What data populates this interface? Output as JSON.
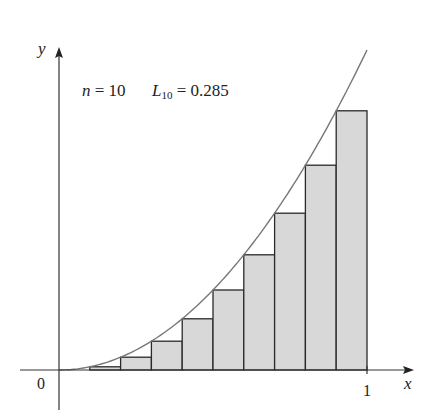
{
  "chart_data": {
    "type": "bar",
    "title": "",
    "annotation": {
      "n_label": "n",
      "n_eq": " = 10",
      "L_label": "L",
      "L_sub": "10",
      "L_eq": " = 0.285"
    },
    "function": "x^2",
    "method": "left Riemann sum",
    "n": 10,
    "sum_value": 0.285,
    "xlabel": "x",
    "ylabel": "y",
    "x_ticks": [
      {
        "value": 0,
        "label": "0"
      },
      {
        "value": 1,
        "label": "1"
      }
    ],
    "xlim": [
      0,
      1
    ],
    "ylim": [
      0,
      1
    ],
    "grid": false,
    "legend": false,
    "categories": [
      "0",
      "0.1",
      "0.2",
      "0.3",
      "0.4",
      "0.5",
      "0.6",
      "0.7",
      "0.8",
      "0.9"
    ],
    "x": [
      0,
      0.1,
      0.2,
      0.3,
      0.4,
      0.5,
      0.6,
      0.7,
      0.8,
      0.9
    ],
    "values": [
      0,
      0.01,
      0.04,
      0.09,
      0.16,
      0.25,
      0.36,
      0.49,
      0.64,
      0.81
    ],
    "bar_width": 0.1,
    "colors": {
      "bar_fill": "#d8d8d8",
      "bar_stroke": "#2a2a2a",
      "curve": "#777777",
      "axis": "#333333"
    }
  }
}
